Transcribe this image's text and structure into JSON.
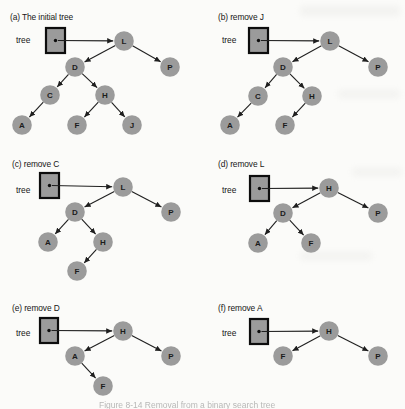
{
  "colors": {
    "background": "#fbfbf9",
    "node_fill": "#9b9b9b",
    "node_text": "#1c1c1c",
    "edge": "#1f1f1f",
    "box_fill": "#9b9b9b",
    "box_stroke": "#0d0d0d",
    "label": "#161616",
    "caption": "#8a8a8a"
  },
  "node_radius": 9.8,
  "caption": {
    "text": "Figure 8-14  Removal from a binary search tree"
  },
  "panels": [
    {
      "id": "a",
      "label": {
        "text": "(a) The initial tree",
        "x": 10,
        "y": 20
      },
      "pointer": {
        "label": "tree",
        "label_x": 16,
        "label_y": 43,
        "box": {
          "x": 46,
          "y": 28,
          "w": 19,
          "h": 25
        }
      },
      "root": "L",
      "nodes": [
        {
          "id": "L",
          "x": 124,
          "y": 41
        },
        {
          "id": "D",
          "x": 75,
          "y": 67
        },
        {
          "id": "P",
          "x": 170,
          "y": 67
        },
        {
          "id": "C",
          "x": 50,
          "y": 95
        },
        {
          "id": "H",
          "x": 105,
          "y": 95
        },
        {
          "id": "A",
          "x": 22,
          "y": 125
        },
        {
          "id": "F",
          "x": 77,
          "y": 125
        },
        {
          "id": "J",
          "x": 132,
          "y": 125
        }
      ],
      "edges": [
        [
          "L",
          "D"
        ],
        [
          "L",
          "P"
        ],
        [
          "D",
          "C"
        ],
        [
          "D",
          "H"
        ],
        [
          "C",
          "A"
        ],
        [
          "H",
          "F"
        ],
        [
          "H",
          "J"
        ]
      ]
    },
    {
      "id": "b",
      "label": {
        "text": "(b) remove J",
        "x": 218,
        "y": 20
      },
      "pointer": {
        "label": "tree",
        "label_x": 222,
        "label_y": 43,
        "box": {
          "x": 249,
          "y": 28,
          "w": 19,
          "h": 25
        }
      },
      "root": "L",
      "nodes": [
        {
          "id": "L",
          "x": 330,
          "y": 41
        },
        {
          "id": "D",
          "x": 283,
          "y": 67
        },
        {
          "id": "P",
          "x": 378,
          "y": 67
        },
        {
          "id": "C",
          "x": 258,
          "y": 96
        },
        {
          "id": "H",
          "x": 312,
          "y": 96
        },
        {
          "id": "A",
          "x": 230,
          "y": 125
        },
        {
          "id": "F",
          "x": 285,
          "y": 125
        }
      ],
      "edges": [
        [
          "L",
          "D"
        ],
        [
          "L",
          "P"
        ],
        [
          "D",
          "C"
        ],
        [
          "D",
          "H"
        ],
        [
          "C",
          "A"
        ],
        [
          "H",
          "F"
        ]
      ]
    },
    {
      "id": "c",
      "label": {
        "text": "(c) remove C",
        "x": 12,
        "y": 167
      },
      "pointer": {
        "label": "tree",
        "label_x": 16,
        "label_y": 193,
        "box": {
          "x": 40,
          "y": 173,
          "w": 19,
          "h": 25
        }
      },
      "root": "L",
      "nodes": [
        {
          "id": "L",
          "x": 123,
          "y": 187
        },
        {
          "id": "D",
          "x": 75,
          "y": 212
        },
        {
          "id": "P",
          "x": 171,
          "y": 212
        },
        {
          "id": "A",
          "x": 48,
          "y": 242
        },
        {
          "id": "H",
          "x": 103,
          "y": 242
        },
        {
          "id": "F",
          "x": 77,
          "y": 271
        }
      ],
      "edges": [
        [
          "L",
          "D"
        ],
        [
          "L",
          "P"
        ],
        [
          "D",
          "A"
        ],
        [
          "D",
          "H"
        ],
        [
          "H",
          "F"
        ]
      ]
    },
    {
      "id": "d",
      "label": {
        "text": "(d) remove L",
        "x": 218,
        "y": 167
      },
      "pointer": {
        "label": "tree",
        "label_x": 222,
        "label_y": 193,
        "box": {
          "x": 250,
          "y": 176,
          "w": 19,
          "h": 25
        }
      },
      "root": "H",
      "nodes": [
        {
          "id": "H",
          "x": 329,
          "y": 188
        },
        {
          "id": "D",
          "x": 283,
          "y": 213
        },
        {
          "id": "P",
          "x": 378,
          "y": 213
        },
        {
          "id": "A",
          "x": 258,
          "y": 243
        },
        {
          "id": "F",
          "x": 311,
          "y": 243
        }
      ],
      "edges": [
        [
          "H",
          "D"
        ],
        [
          "H",
          "P"
        ],
        [
          "D",
          "A"
        ],
        [
          "D",
          "F"
        ]
      ]
    },
    {
      "id": "e",
      "label": {
        "text": "(e) remove D",
        "x": 12,
        "y": 311
      },
      "pointer": {
        "label": "tree",
        "label_x": 16,
        "label_y": 336,
        "box": {
          "x": 40,
          "y": 318,
          "w": 18,
          "h": 25
        }
      },
      "root": "H",
      "nodes": [
        {
          "id": "H",
          "x": 123,
          "y": 331
        },
        {
          "id": "A",
          "x": 75,
          "y": 356
        },
        {
          "id": "P",
          "x": 171,
          "y": 356
        },
        {
          "id": "F",
          "x": 103,
          "y": 386
        }
      ],
      "edges": [
        [
          "H",
          "A"
        ],
        [
          "H",
          "P"
        ],
        [
          "A",
          "F"
        ]
      ]
    },
    {
      "id": "f",
      "label": {
        "text": "(f) remove A",
        "x": 218,
        "y": 311
      },
      "pointer": {
        "label": "tree",
        "label_x": 222,
        "label_y": 336,
        "box": {
          "x": 250,
          "y": 319,
          "w": 18,
          "h": 25
        }
      },
      "root": "H",
      "nodes": [
        {
          "id": "H",
          "x": 329,
          "y": 331
        },
        {
          "id": "F",
          "x": 283,
          "y": 356
        },
        {
          "id": "P",
          "x": 378,
          "y": 356
        }
      ],
      "edges": [
        [
          "H",
          "F"
        ],
        [
          "H",
          "P"
        ]
      ]
    }
  ]
}
